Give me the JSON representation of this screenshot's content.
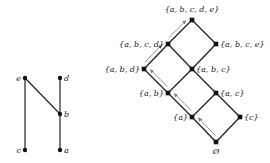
{
  "colors": {
    "line": "#222222",
    "node": "#111111",
    "arrow": "#777777",
    "background": "#ffffff"
  },
  "poset": {
    "nodes": [
      {
        "id": "e",
        "label": "e",
        "x": 25,
        "y": 78,
        "label_side": "left"
      },
      {
        "id": "d",
        "label": "d",
        "x": 60,
        "y": 78,
        "label_side": "right"
      },
      {
        "id": "b",
        "label": "b",
        "x": 60,
        "y": 114,
        "label_side": "right"
      },
      {
        "id": "c",
        "label": "c",
        "x": 25,
        "y": 150,
        "label_side": "left"
      },
      {
        "id": "a",
        "label": "a",
        "x": 60,
        "y": 150,
        "label_side": "right"
      }
    ],
    "edges": [
      [
        "c",
        "e"
      ],
      [
        "b",
        "e"
      ],
      [
        "a",
        "b"
      ],
      [
        "b",
        "d"
      ]
    ]
  },
  "lattice": {
    "nodes": [
      {
        "id": "abcde",
        "label": "{a, b, c, d, e}",
        "x": 192,
        "y": 20
      },
      {
        "id": "abcd",
        "label": "{a, b, c, d}",
        "x": 168,
        "y": 44
      },
      {
        "id": "abce",
        "label": "{a, b, c, e}",
        "x": 216,
        "y": 44
      },
      {
        "id": "abd",
        "label": "{a, b, d}",
        "x": 144,
        "y": 69
      },
      {
        "id": "abc",
        "label": "{a, b, c}",
        "x": 192,
        "y": 69
      },
      {
        "id": "ab",
        "label": "{a, b}",
        "x": 168,
        "y": 93
      },
      {
        "id": "ac",
        "label": "{a, c}",
        "x": 216,
        "y": 93
      },
      {
        "id": "a",
        "label": "{a}",
        "x": 192,
        "y": 117
      },
      {
        "id": "c",
        "label": "{c}",
        "x": 240,
        "y": 117
      },
      {
        "id": "empty",
        "label": "Ø",
        "x": 216,
        "y": 142
      }
    ],
    "edges": [
      [
        "empty",
        "a"
      ],
      [
        "empty",
        "c"
      ],
      [
        "a",
        "ab"
      ],
      [
        "a",
        "ac"
      ],
      [
        "c",
        "ac"
      ],
      [
        "ab",
        "abd"
      ],
      [
        "ab",
        "abc"
      ],
      [
        "ac",
        "abc"
      ],
      [
        "abd",
        "abcd"
      ],
      [
        "abc",
        "abcd"
      ],
      [
        "abc",
        "abce"
      ],
      [
        "abcd",
        "abcde"
      ],
      [
        "abce",
        "abcde"
      ]
    ],
    "chain_path": [
      "empty",
      "a",
      "ab",
      "abd",
      "abcd",
      "abcde"
    ]
  }
}
